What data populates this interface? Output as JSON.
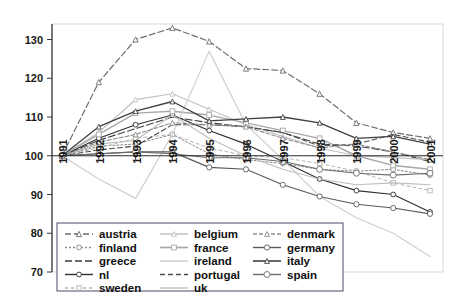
{
  "chart_data": {
    "type": "line",
    "title": "",
    "xlabel": "",
    "ylabel": "",
    "x": [
      "1991",
      "1992",
      "1993",
      "1994",
      "1995",
      "1996",
      "1997",
      "1998",
      "1999",
      "2000",
      "2001"
    ],
    "categories": [
      "1991",
      "1992",
      "1993",
      "1994",
      "1995",
      "1996",
      "1997",
      "1998",
      "1999",
      "2000",
      "2001"
    ],
    "ylim": [
      70,
      134
    ],
    "yticks": [
      70,
      80,
      90,
      100,
      110,
      120,
      130
    ],
    "ytick_labels": [
      "70",
      "80",
      "90",
      "100",
      "110",
      "120",
      "130"
    ],
    "grid": false,
    "baseline": 100,
    "legend_position": "bottom",
    "series": [
      {
        "name": "austria",
        "values": [
          100,
          119.0,
          130.0,
          133.0,
          129.5,
          122.5,
          122.0,
          116.0,
          108.5,
          106.0,
          104.5
        ],
        "color": "#6e6e6e",
        "dash": "6,3",
        "width": 1.2,
        "marker": "triangle",
        "marker_size": 2.6
      },
      {
        "name": "finland",
        "values": [
          100,
          102.5,
          103.0,
          105.5,
          100.5,
          99.0,
          98.0,
          96.5,
          96.0,
          96.5,
          95.0
        ],
        "color": "#8a8a8a",
        "dash": "2,2",
        "width": 1.0,
        "marker": "circle",
        "marker_size": 2.4
      },
      {
        "name": "greece",
        "values": [
          100,
          104.0,
          107.0,
          110.0,
          108.5,
          107.5,
          106.0,
          103.0,
          102.5,
          101.0,
          98.5
        ],
        "color": "#3d3d3d",
        "dash": "7,3",
        "width": 1.1,
        "marker": "none",
        "marker_size": 0
      },
      {
        "name": "nl",
        "values": [
          100,
          104.5,
          108.0,
          110.5,
          106.5,
          103.0,
          98.5,
          94.0,
          91.0,
          90.0,
          85.5
        ],
        "color": "#2f2f2f",
        "dash": "none",
        "width": 1.1,
        "marker": "circle",
        "marker_size": 2.4
      },
      {
        "name": "sweden",
        "values": [
          100,
          102.0,
          104.5,
          105.5,
          102.0,
          100.0,
          99.5,
          98.0,
          96.0,
          93.0,
          91.0
        ],
        "color": "#b4b4b4",
        "dash": "3,3",
        "width": 1.0,
        "marker": "square",
        "marker_size": 2.2
      },
      {
        "name": "belgium",
        "values": [
          100,
          106.0,
          114.5,
          116.0,
          112.0,
          108.0,
          105.0,
          102.0,
          100.0,
          99.5,
          99.0
        ],
        "color": "#c2c2c2",
        "dash": "none",
        "width": 1.2,
        "marker": "triangle",
        "marker_size": 2.4
      },
      {
        "name": "france",
        "values": [
          100,
          105.5,
          111.0,
          111.5,
          110.5,
          108.5,
          106.5,
          104.5,
          100.0,
          97.5,
          96.5
        ],
        "color": "#a8a8a8",
        "dash": "none",
        "width": 1.4,
        "marker": "square",
        "marker_size": 2.4
      },
      {
        "name": "ireland",
        "values": [
          100,
          94.0,
          89.0,
          105.5,
          127.0,
          108.0,
          99.0,
          89.5,
          84.0,
          80.0,
          74.0
        ],
        "color": "#cfcfcf",
        "dash": "none",
        "width": 1.2,
        "marker": "none",
        "marker_size": 0
      },
      {
        "name": "portugal",
        "values": [
          100,
          101.5,
          102.5,
          108.0,
          108.0,
          107.5,
          106.0,
          102.5,
          103.0,
          105.5,
          103.5
        ],
        "color": "#4a4a4a",
        "dash": "5,3",
        "width": 1.1,
        "marker": "none",
        "marker_size": 0
      },
      {
        "name": "uk",
        "values": [
          100,
          103.0,
          104.0,
          110.5,
          104.5,
          100.0,
          96.5,
          94.0,
          92.5,
          93.0,
          92.5
        ],
        "color": "#bdbdbd",
        "dash": "none",
        "width": 1.1,
        "marker": "none",
        "marker_size": 0
      },
      {
        "name": "denmark",
        "values": [
          100,
          103.5,
          105.5,
          108.5,
          108.0,
          107.5,
          104.5,
          102.0,
          103.0,
          101.0,
          99.0
        ],
        "color": "#8f8f8f",
        "dash": "4,2",
        "width": 1.1,
        "marker": "triangle",
        "marker_size": 2.4
      },
      {
        "name": "germany",
        "values": [
          100,
          100.5,
          101.0,
          101.0,
          97.0,
          96.5,
          92.5,
          89.5,
          87.5,
          86.5,
          85.0
        ],
        "color": "#5a5a5a",
        "dash": "none",
        "width": 1.1,
        "marker": "circle",
        "marker_size": 2.6
      },
      {
        "name": "italy",
        "values": [
          100,
          107.5,
          111.5,
          114.0,
          109.0,
          109.5,
          110.0,
          108.5,
          104.5,
          105.0,
          103.0
        ],
        "color": "#404040",
        "dash": "none",
        "width": 1.3,
        "marker": "triangle",
        "marker_size": 2.4
      },
      {
        "name": "spain",
        "values": [
          100,
          100.5,
          101.0,
          100.5,
          99.5,
          99.5,
          98.5,
          96.5,
          95.5,
          95.0,
          95.5
        ],
        "color": "#6b6b6b",
        "dash": "none",
        "width": 1.1,
        "marker": "circle",
        "marker_size": 3.0
      }
    ],
    "legend_columns": [
      [
        {
          "label": "austria",
          "series": "austria"
        },
        {
          "label": "finland",
          "series": "finland"
        },
        {
          "label": "greece",
          "series": "greece"
        },
        {
          "label": "nl",
          "series": "nl"
        },
        {
          "label": "sweden",
          "series": "sweden"
        }
      ],
      [
        {
          "label": "belgium",
          "series": "belgium"
        },
        {
          "label": "france",
          "series": "france"
        },
        {
          "label": "ireland",
          "series": "ireland"
        },
        {
          "label": "portugal",
          "series": "portugal"
        },
        {
          "label": "uk",
          "series": "uk"
        }
      ],
      [
        {
          "label": "denmark",
          "series": "denmark"
        },
        {
          "label": "germany",
          "series": "germany"
        },
        {
          "label": "italy",
          "series": "italy"
        },
        {
          "label": "spain",
          "series": "spain"
        }
      ]
    ]
  }
}
